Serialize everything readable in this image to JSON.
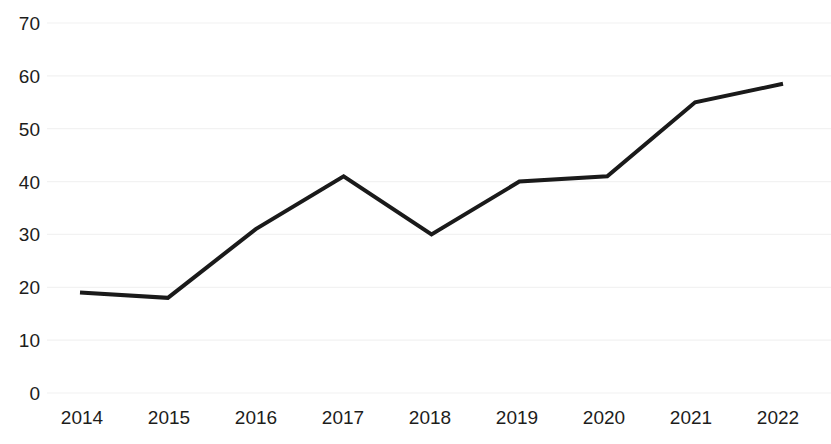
{
  "chart_data": {
    "type": "line",
    "title": "",
    "subtitle": "",
    "xlabel": "",
    "ylabel": "",
    "categories": [
      "2014",
      "2015",
      "2016",
      "2017",
      "2018",
      "2019",
      "2020",
      "2021",
      "2022"
    ],
    "series": [
      {
        "name": "",
        "values": [
          19,
          18,
          31,
          41,
          30,
          40,
          41,
          55,
          58.5
        ]
      }
    ],
    "ylim": [
      0,
      70
    ],
    "y_ticks": [
      0,
      10,
      20,
      30,
      40,
      50,
      60,
      70
    ],
    "y_tick_labels": [
      "0",
      "10",
      "20",
      "30",
      "40",
      "50",
      "60",
      "70"
    ],
    "x_tick_labels": [
      "2014",
      "2015",
      "2016",
      "2017",
      "2018",
      "2019",
      "2020",
      "2021",
      "2022"
    ],
    "grid": true,
    "grid_axis": "y",
    "legend": false,
    "legend_position": "none",
    "line_color": "#1a1a1a",
    "line_width": 4,
    "grid_color": "#f2f2f2",
    "background_color": "#ffffff",
    "text_color": "#1d1d1b",
    "markers": false,
    "annotations": []
  },
  "layout": {
    "plot_left": 47,
    "plot_right": 831,
    "y_top_px": 23,
    "y_zero_px": 393,
    "first_tick_x": 82,
    "tick_spacing": 87,
    "line_start_x": 80,
    "line_end_x": 783
  }
}
